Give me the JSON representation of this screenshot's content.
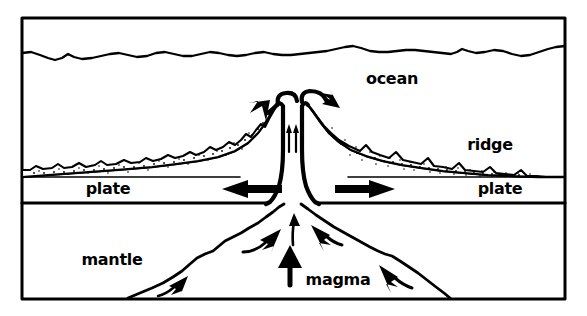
{
  "diagram": {
    "type": "cross-section-schematic",
    "style": "black-and-white line drawing",
    "colors": {
      "stroke": "#000000",
      "background": "#ffffff",
      "fill": "#ffffff"
    },
    "frame": {
      "x": 22,
      "y": 18,
      "width": 543,
      "height": 281,
      "stroke_width": 3
    },
    "labels": [
      {
        "id": "ocean",
        "text": "ocean",
        "x": 392,
        "y": 84,
        "anchor": "middle"
      },
      {
        "id": "ridge",
        "text": "ridge",
        "x": 490,
        "y": 150,
        "anchor": "middle"
      },
      {
        "id": "plate_left",
        "text": "plate",
        "x": 108,
        "y": 194,
        "anchor": "middle"
      },
      {
        "id": "plate_right",
        "text": "plate",
        "x": 500,
        "y": 194,
        "anchor": "middle"
      },
      {
        "id": "mantle",
        "text": "mantle",
        "x": 112,
        "y": 265,
        "anchor": "middle"
      },
      {
        "id": "magma",
        "text": "magma",
        "x": 338,
        "y": 285,
        "anchor": "middle"
      }
    ],
    "features": {
      "ocean_surface": "wavy horizontal line near top of frame",
      "ridge": "twin symmetric peaks with a narrow central rift valley",
      "sediment": "stippled bumpy wedge layers thinning away from the ridge crest",
      "plate_layer": "horizontal band between sediment base and thick lower boundary line",
      "magma_plume": "broad irregular dome rising from the bottom of the frame into the rift"
    },
    "arrows": [
      {
        "id": "lava-arrow-left",
        "kind": "curved",
        "direction": "down-left",
        "meaning": "erupting lava spreading left"
      },
      {
        "id": "lava-arrow-right",
        "kind": "curved",
        "direction": "right",
        "meaning": "erupting lava spreading right"
      },
      {
        "id": "rift-arrow-inner-left",
        "kind": "straight-thin",
        "direction": "up",
        "meaning": "magma rising in rift"
      },
      {
        "id": "rift-arrow-inner-right",
        "kind": "straight-thin",
        "direction": "up",
        "meaning": "magma rising in rift"
      },
      {
        "id": "plate-arrow-left",
        "kind": "block",
        "direction": "left",
        "meaning": "plate moves left"
      },
      {
        "id": "plate-arrow-right",
        "kind": "block",
        "direction": "right",
        "meaning": "plate moves right"
      },
      {
        "id": "magma-arrow-center-top",
        "kind": "straight-thin",
        "direction": "up",
        "meaning": "magma ascending into rift"
      },
      {
        "id": "magma-arrow-center-main",
        "kind": "block-thick",
        "direction": "up",
        "meaning": "main magma upwelling"
      },
      {
        "id": "magma-arrow-mid-left",
        "kind": "curved",
        "direction": "up-right",
        "meaning": "convecting magma"
      },
      {
        "id": "magma-arrow-mid-right",
        "kind": "curved",
        "direction": "up-left",
        "meaning": "convecting magma"
      },
      {
        "id": "magma-arrow-far-left",
        "kind": "curved",
        "direction": "up-right",
        "meaning": "convecting mantle inflow"
      },
      {
        "id": "magma-arrow-far-right",
        "kind": "curved",
        "direction": "up-left",
        "meaning": "convecting mantle inflow"
      }
    ]
  }
}
